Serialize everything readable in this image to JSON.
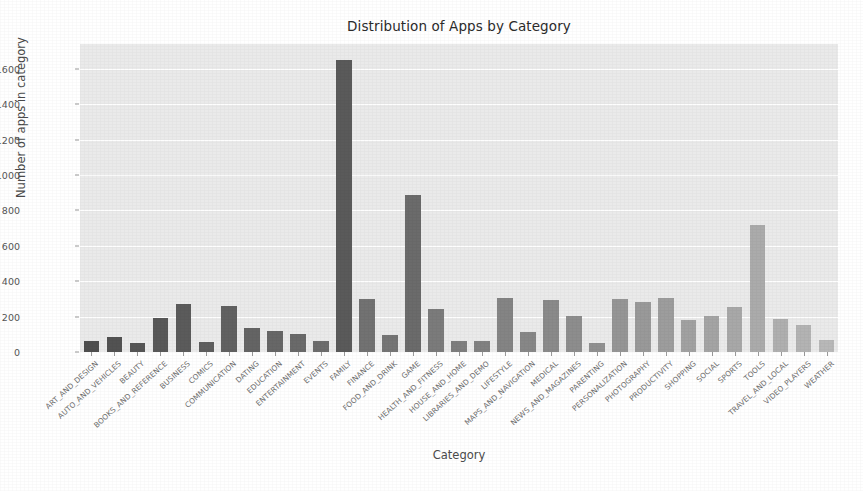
{
  "chart_data": {
    "type": "bar",
    "title": "Distribution of Apps by Category",
    "xlabel": "Category",
    "ylabel": "Number of apps in category",
    "ylim": [
      0,
      1740
    ],
    "yticks": [
      0,
      200,
      400,
      600,
      800,
      1000,
      1200,
      1400,
      1600
    ],
    "grid": true,
    "legend": null,
    "categories": [
      "ART_AND_DESIGN",
      "AUTO_AND_VEHICLES",
      "BEAUTY",
      "BOOKS_AND_REFERENCE",
      "BUSINESS",
      "COMICS",
      "COMMUNICATION",
      "DATING",
      "EDUCATION",
      "ENTERTAINMENT",
      "EVENTS",
      "FAMILY",
      "FINANCE",
      "FOOD_AND_DRINK",
      "GAME",
      "HEALTH_AND_FITNESS",
      "HOUSE_AND_HOME",
      "LIBRARIES_AND_DEMO",
      "LIFESTYLE",
      "MAPS_AND_NAVIGATION",
      "MEDICAL",
      "NEWS_AND_MAGAZINES",
      "PARENTING",
      "PERSONALIZATION",
      "PHOTOGRAPHY",
      "PRODUCTIVITY",
      "SHOPPING",
      "SOCIAL",
      "SPORTS",
      "TOOLS",
      "TRAVEL_AND_LOCAL",
      "VIDEO_PLAYERS",
      "WEATHER"
    ],
    "values": [
      64,
      85,
      53,
      190,
      270,
      56,
      258,
      135,
      119,
      102,
      64,
      1650,
      300,
      95,
      885,
      245,
      60,
      64,
      305,
      115,
      292,
      204,
      50,
      300,
      281,
      305,
      180,
      203,
      255,
      715,
      187,
      150,
      70
    ],
    "bar_colors": [
      "#4f4f4f",
      "#525252",
      "#555555",
      "#585858",
      "#5b5b5b",
      "#5e5e5e",
      "#616161",
      "#646464",
      "#676767",
      "#6a6a6a",
      "#6d6d6d",
      "#5a5a5a",
      "#727272",
      "#757575",
      "#6b6b6b",
      "#7b7b7b",
      "#7e7e7e",
      "#818181",
      "#848484",
      "#878787",
      "#8a8a8a",
      "#8d8d8d",
      "#909090",
      "#959595",
      "#999999",
      "#9d9d9d",
      "#a1a1a1",
      "#a4a4a4",
      "#a8a8a8",
      "#ababab",
      "#afafaf",
      "#b3b3b3",
      "#b8b8b8"
    ],
    "plot_background": "#eaeaea",
    "grid_color": "#ffffff",
    "figure_background": "#ffffff"
  }
}
